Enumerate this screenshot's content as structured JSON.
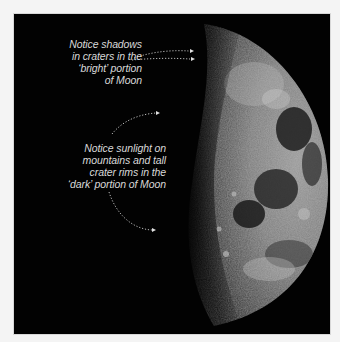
{
  "figure": {
    "background_color": "#020202",
    "frame_color": "#f4f4f4",
    "text_color": "#d9d9d9"
  },
  "annotations": [
    {
      "id": "bright-portion",
      "lines": [
        "Notice shadows",
        "in craters in the",
        "‘bright’ portion",
        "of Moon"
      ],
      "arrow_count": 2
    },
    {
      "id": "dark-portion",
      "lines": [
        "Notice sunlight on",
        "mountains and tall",
        "crater rims in the",
        "‘dark’ portion of Moon"
      ],
      "arrow_count": 2
    }
  ]
}
